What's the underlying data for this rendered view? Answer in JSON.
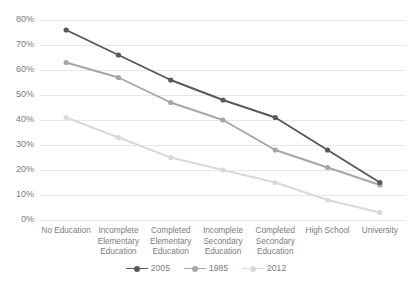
{
  "chart_data": {
    "type": "line",
    "title": "",
    "xlabel": "",
    "ylabel": "",
    "grid": true,
    "legend_position": "bottom",
    "ylim": [
      0,
      80
    ],
    "ytick_labels": [
      "80%",
      "70%",
      "60%",
      "50%",
      "40%",
      "30%",
      "20%",
      "10%",
      "0%"
    ],
    "ytick_values": [
      80,
      70,
      60,
      50,
      40,
      30,
      20,
      10,
      0
    ],
    "categories": [
      "No Education",
      "Incomplete Elementary Education",
      "Completed Elementary Education",
      "Incomplete Secondary Education",
      "Completed Secondary Education",
      "High School",
      "University"
    ],
    "category_lines": [
      [
        "No Education"
      ],
      [
        "Incomplete",
        "Elementary",
        "Education"
      ],
      [
        "Completed",
        "Elementary",
        "Education"
      ],
      [
        "Incomplete",
        "Secondary",
        "Education"
      ],
      [
        "Completed",
        "Secondary",
        "Education"
      ],
      [
        "High School"
      ],
      [
        "University"
      ]
    ],
    "series": [
      {
        "name": "2005",
        "color": "#595959",
        "values": [
          76,
          66,
          56,
          48,
          41,
          28,
          15
        ]
      },
      {
        "name": "1985",
        "color": "#a6a6a6",
        "values": [
          63,
          57,
          47,
          40,
          28,
          21,
          14
        ]
      },
      {
        "name": "2012",
        "color": "#d9d9d9",
        "values": [
          41,
          33,
          25,
          20,
          15,
          8,
          3
        ]
      }
    ]
  },
  "axes": {
    "gridline_color": "#e8e8e8",
    "tick_color": "#7b7b7b"
  },
  "legend": {
    "items": [
      {
        "label": "2005",
        "color": "#595959"
      },
      {
        "label": "1985",
        "color": "#a6a6a6"
      },
      {
        "label": "2012",
        "color": "#d9d9d9"
      }
    ]
  }
}
